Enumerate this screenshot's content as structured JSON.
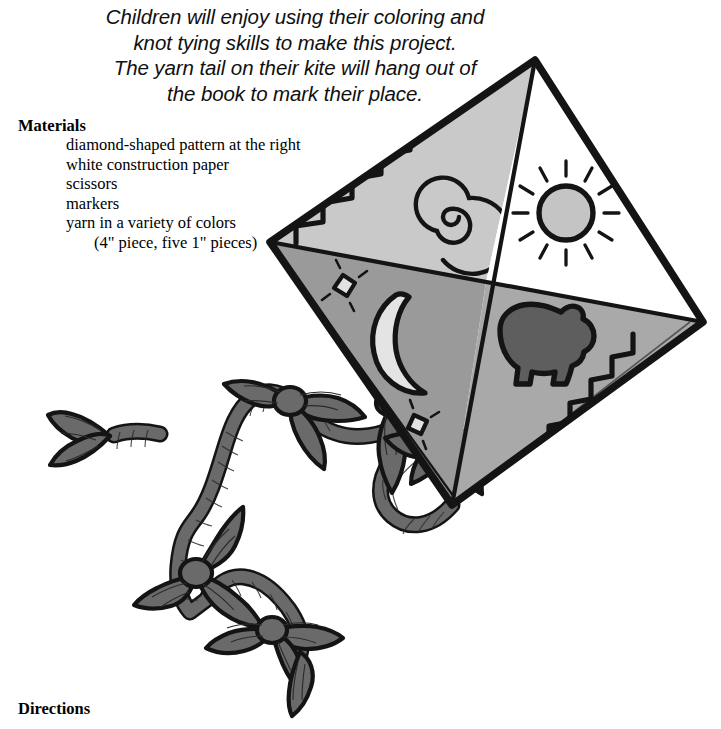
{
  "intro": {
    "lines": [
      "Children will enjoy using their coloring and",
      "knot tying skills to make this project.",
      "The yarn tail on their kite will hang out of",
      "the book to mark their place."
    ]
  },
  "materials": {
    "heading": "Materials",
    "items": [
      {
        "text": "diamond-shaped pattern at the right",
        "indent": false
      },
      {
        "text": "white construction paper",
        "indent": false
      },
      {
        "text": "scissors",
        "indent": false
      },
      {
        "text": "markers",
        "indent": false
      },
      {
        "text": "yarn in a variety of colors",
        "indent": false
      },
      {
        "text": "(4\" piece, five 1\" pieces)",
        "indent": true
      }
    ]
  },
  "directions": {
    "heading": "Directions"
  },
  "illustration": {
    "name": "kite-with-knotted-yarn-tail",
    "description": "Diamond kite divided into four quadrants with a long knotted yarn tail",
    "kite": {
      "vertices": {
        "top": [
          535,
          60
        ],
        "left": [
          270,
          242
        ],
        "right": [
          703,
          322
        ],
        "bottom": [
          452,
          505
        ]
      },
      "center": [
        486,
        282
      ],
      "quadrants": [
        {
          "name": "top-left",
          "fill": "#c9c9c9",
          "motifs": [
            "stair-step-zigzag",
            "spiral"
          ]
        },
        {
          "name": "top-right",
          "fill": "#ffffff",
          "motifs": [
            "sun"
          ]
        },
        {
          "name": "bottom-left",
          "fill": "#9a9a9a",
          "motifs": [
            "crescent-moon",
            "star",
            "star"
          ]
        },
        {
          "name": "bottom-right",
          "fill": "#a9a9a9",
          "motifs": [
            "bear",
            "stair-step-zigzag"
          ]
        }
      ]
    },
    "motif_colors": {
      "outline": "#111111",
      "sun_disc": "#c4c4c4",
      "moon": "#e4e4e4",
      "star": "#e2e2e2",
      "bear": "#5e5e5e"
    },
    "tail": {
      "color": "#6a6a6a",
      "outline": "#141414",
      "knot_count": 5,
      "description": "twisted yarn cord with five bow-tie knots"
    }
  }
}
